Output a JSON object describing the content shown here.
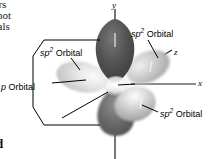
{
  "figure": {
    "type": "orbital-diagram",
    "background_color": "#ffffff"
  },
  "body_text": {
    "line1": "hers",
    "line2": "s not",
    "line3": "bitals",
    "bold_fragment": "d"
  },
  "labels": {
    "sp2_top": {
      "prefix": "sp",
      "sup": "2",
      "suffix": " Orbital"
    },
    "sp2_left": {
      "prefix": "sp",
      "sup": "2",
      "suffix": " Orbital"
    },
    "p_orbital": {
      "prefix": "p",
      "suffix": " Orbital"
    },
    "sp2_bottom": {
      "prefix": "sp",
      "sup": "2",
      "suffix": " Orbital"
    }
  },
  "axes": {
    "y": "y",
    "z": "z",
    "x": "x"
  },
  "colors": {
    "p_lobe_dark": "#4a4a4a",
    "p_lobe_shadow": "#2e2e2e",
    "sp2_light": "#d8d8d8",
    "sp2_mid": "#b4b4b4",
    "sp2_dark": "#8a8a8a",
    "nucleus_highlight": "#f2f2f2",
    "line": "#000000",
    "text": "#000000"
  },
  "orbitals": [
    {
      "name": "p-orbital-upper-lobe",
      "direction": "up",
      "shade": "dark"
    },
    {
      "name": "p-orbital-lower-lobe",
      "direction": "down",
      "shade": "dark"
    },
    {
      "name": "sp2-orbital-left",
      "direction": "left",
      "shade": "light"
    },
    {
      "name": "sp2-orbital-right-back",
      "direction": "right-up",
      "shade": "mid"
    },
    {
      "name": "sp2-orbital-front-down",
      "direction": "front-down",
      "shade": "mid"
    }
  ]
}
